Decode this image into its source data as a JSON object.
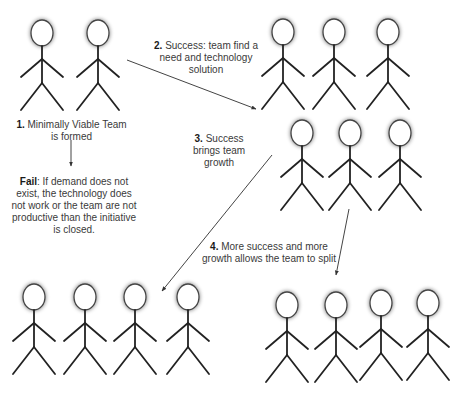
{
  "diagram": {
    "colors": {
      "stroke": "#222222",
      "text": "#3a3a3a",
      "arrow": "#444444",
      "background": "#ffffff"
    },
    "teams": [
      {
        "id": "team-1",
        "name": "minimally-viable-team",
        "figures": [
          {
            "x": 42,
            "y": 33
          },
          {
            "x": 98,
            "y": 33
          }
        ]
      },
      {
        "id": "team-2",
        "name": "success-team",
        "figures": [
          {
            "x": 283,
            "y": 32
          },
          {
            "x": 334,
            "y": 32
          },
          {
            "x": 388,
            "y": 32
          }
        ]
      },
      {
        "id": "team-3",
        "name": "growth-team",
        "figures": [
          {
            "x": 302,
            "y": 133
          },
          {
            "x": 350,
            "y": 133
          },
          {
            "x": 400,
            "y": 133
          }
        ]
      },
      {
        "id": "team-4",
        "name": "split-team-left",
        "figures": [
          {
            "x": 34,
            "y": 297
          },
          {
            "x": 85,
            "y": 297
          },
          {
            "x": 135,
            "y": 297
          },
          {
            "x": 188,
            "y": 297
          }
        ]
      },
      {
        "id": "team-5",
        "name": "split-team-right",
        "figures": [
          {
            "x": 287,
            "y": 305
          },
          {
            "x": 336,
            "y": 305
          },
          {
            "x": 381,
            "y": 303
          },
          {
            "x": 428,
            "y": 303
          }
        ]
      }
    ],
    "labels": {
      "step1": {
        "num": "1.",
        "text": " Minimally Viable Team is formed"
      },
      "step2": {
        "num": "2.",
        "text": " Success: team find a need and technology solution"
      },
      "step3": {
        "num": "3.",
        "text": " Success brings team growth"
      },
      "step4": {
        "num": "4.",
        "text": " More success and more growth allows the team to split"
      },
      "fail": {
        "num": "Fail",
        "text": ": If demand does not exist, the technology does not work or the team are not productive than the initiative is closed."
      }
    },
    "arrows": [
      {
        "name": "arrow-step1-to-fail",
        "x1": 71,
        "y1": 140,
        "x2": 71,
        "y2": 166
      },
      {
        "name": "arrow-step2",
        "x1": 127,
        "y1": 60,
        "x2": 256,
        "y2": 109
      },
      {
        "name": "arrow-step3",
        "x1": 272,
        "y1": 155,
        "x2": 162,
        "y2": 291
      },
      {
        "name": "arrow-step4",
        "x1": 349,
        "y1": 209,
        "x2": 336,
        "y2": 275
      }
    ]
  }
}
